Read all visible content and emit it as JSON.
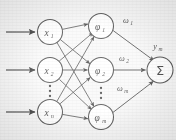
{
  "diagram": {
    "type": "neural-network",
    "background_color": "#f2f1ef",
    "stroke_color": "#2b2b2b",
    "node_fill_color": "#fbfaf8",
    "layers": [
      {
        "name": "input-layer",
        "nodes": [
          {
            "id": "x1",
            "label": "x",
            "subscript": "1",
            "cx": 50,
            "cy": 32,
            "r": 12.5
          },
          {
            "id": "x2",
            "label": "x",
            "subscript": "2",
            "cx": 50,
            "cy": 70,
            "r": 12.5
          },
          {
            "id": "xn",
            "label": "x",
            "subscript": "n",
            "cx": 50,
            "cy": 112,
            "r": 12.5
          }
        ],
        "ellipsis": {
          "cx": 50,
          "cy": 91,
          "dots": 3
        }
      },
      {
        "name": "hidden-layer",
        "nodes": [
          {
            "id": "phi1",
            "label": "φ",
            "subscript": "1",
            "cx": 101,
            "cy": 26,
            "r": 12.5
          },
          {
            "id": "phi2",
            "label": "φ",
            "subscript": "2",
            "cx": 101,
            "cy": 70,
            "r": 12.5
          },
          {
            "id": "phim",
            "label": "φ",
            "subscript": "m",
            "cx": 101,
            "cy": 117,
            "r": 12.5
          }
        ],
        "ellipsis": {
          "cx": 101,
          "cy": 93,
          "dots": 3
        }
      },
      {
        "name": "output-layer",
        "nodes": [
          {
            "id": "sum",
            "label": "Σ",
            "subscript": "",
            "cx": 160,
            "cy": 70,
            "r": 13
          }
        ]
      }
    ],
    "input_arrows": [
      {
        "id": "input-arrow-1",
        "x1": 6,
        "y1": 32,
        "x2": 36,
        "y2": 32
      },
      {
        "id": "input-arrow-2",
        "x1": 6,
        "y1": 70,
        "x2": 36,
        "y2": 70
      },
      {
        "id": "input-arrow-3",
        "x1": 6,
        "y1": 112,
        "x2": 36,
        "y2": 112
      }
    ],
    "weights": [
      {
        "id": "w1",
        "label": "ω",
        "subscript": "1",
        "x": 126,
        "y": 22
      },
      {
        "id": "w2",
        "label": "ω",
        "subscript": "2",
        "x": 122,
        "y": 60
      },
      {
        "id": "wm",
        "label": "ω",
        "subscript": "m",
        "x": 120,
        "y": 90
      }
    ],
    "output_label": {
      "id": "ym",
      "label": "y",
      "subscript": "m",
      "x": 152,
      "y": 48
    },
    "edges_input_to_hidden": [
      {
        "from": "x1",
        "to": "phi1"
      },
      {
        "from": "x1",
        "to": "phi2"
      },
      {
        "from": "x1",
        "to": "phim"
      },
      {
        "from": "x2",
        "to": "phi1"
      },
      {
        "from": "x2",
        "to": "phi2"
      },
      {
        "from": "x2",
        "to": "phim"
      },
      {
        "from": "xn",
        "to": "phi1"
      },
      {
        "from": "xn",
        "to": "phi2"
      },
      {
        "from": "xn",
        "to": "phim"
      }
    ],
    "edges_hidden_to_output": [
      {
        "from": "phi1",
        "to": "sum",
        "weight": "w1"
      },
      {
        "from": "phi2",
        "to": "sum",
        "weight": "w2"
      },
      {
        "from": "phim",
        "to": "sum",
        "weight": "wm"
      }
    ]
  }
}
